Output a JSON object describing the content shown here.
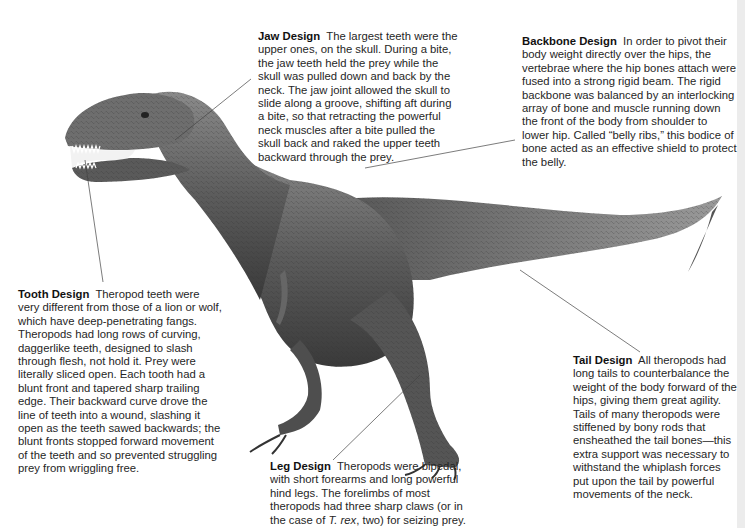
{
  "figure": {
    "callouts": [
      {
        "id": "jaw",
        "title": "Jaw Design",
        "text": "The largest teeth were the upper ones, on the skull. During a bite, the jaw teeth held the prey while the skull was pulled down and back by the neck. The jaw joint allowed the skull to slide along a groove, shifting aft during a bite, so that retracting the powerful neck muscles after a bite pulled the skull back and raked the upper teeth backward through the prey."
      },
      {
        "id": "backbone",
        "title": "Backbone Design",
        "text": "In order to pivot their body weight directly over the hips, the vertebrae where the hip bones attach were fused into a strong rigid beam. The rigid backbone was balanced by an interlocking array of bone and muscle running down the front of the body from shoulder to lower hip. Called “belly ribs,” this bodice of bone acted as an effective shield to protect the belly."
      },
      {
        "id": "tooth",
        "title": "Tooth Design",
        "text": "Theropod teeth were very different from those of a lion or wolf, which have deep-penetrating fangs. Theropods had long rows of curving, daggerlike teeth, designed to slash through flesh, not hold it. Prey were literally sliced open. Each tooth had a blunt front and tapered sharp trailing edge. Their backward curve drove the line of teeth into a wound, slashing it open as the teeth sawed backwards; the blunt fronts stopped forward movement of the teeth and so prevented struggling prey from wriggling free."
      },
      {
        "id": "tail",
        "title": "Tail Design",
        "text": "All theropods had long tails to counterbalance the weight of the body forward of the hips, giving them great agility. Tails of many theropods were stiffened by bony rods that ensheathed the tail bones—this extra support was necessary to withstand the whiplash forces put upon the tail by powerful movements of the neck."
      },
      {
        "id": "leg",
        "title": "Leg Design",
        "text_before": "Theropods were bipedal, with short forearms and long powerful hind legs. The forelimbs of most theropods had three sharp claws (or in the case of ",
        "text_italic": "T. rex",
        "text_after": ", two) for seizing prey."
      }
    ]
  }
}
